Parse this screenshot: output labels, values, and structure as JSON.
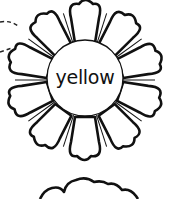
{
  "flowers": [
    {
      "label": "yellow",
      "petal_count": 10,
      "stroke_color": "#111111",
      "fill_color": "#ffffff"
    },
    {
      "label": "",
      "partial": true
    }
  ]
}
